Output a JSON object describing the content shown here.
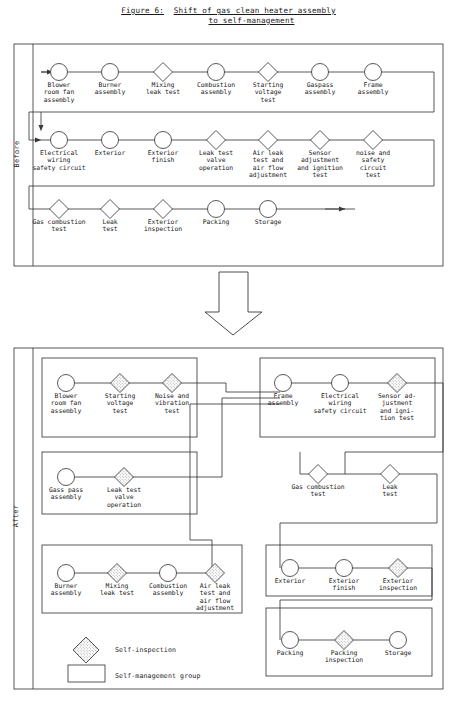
{
  "figure": {
    "label": "Figure 6:",
    "title_line1": "Shift of gas clean heater assembly",
    "title_line2": "to self-management"
  },
  "sections": {
    "before_label": "Before",
    "after_label": "After"
  },
  "legend": {
    "self_inspection": "Self-inspection",
    "self_management_group": "Self-management group"
  },
  "colors": {
    "ink": "#1a1a1a",
    "line": "#3a3a3a",
    "paper": "#ffffff",
    "hatch": "#8a8a8a"
  },
  "before": {
    "row1": [
      {
        "shape": "circle",
        "label": "Blower\nroom fan\nassembly"
      },
      {
        "shape": "circle",
        "label": "Burner\nassembly"
      },
      {
        "shape": "diamond",
        "label": "Mixing\nleak test"
      },
      {
        "shape": "circle",
        "label": "Combustion\nassembly"
      },
      {
        "shape": "diamond",
        "label": "Starting\nvoltage\ntest"
      },
      {
        "shape": "circle",
        "label": "Gaspass\nassembly"
      },
      {
        "shape": "circle",
        "label": "Frame\nassembly"
      }
    ],
    "row2": [
      {
        "shape": "circle",
        "label": "Electrical\nwiring\nsafety circuit"
      },
      {
        "shape": "circle",
        "label": "Exterior"
      },
      {
        "shape": "circle",
        "label": "Exterior\nfinish"
      },
      {
        "shape": "diamond",
        "label": "Leak test\nvalve\noperation"
      },
      {
        "shape": "diamond",
        "label": "Air leak\ntest and\nair flow\nadjustment"
      },
      {
        "shape": "diamond",
        "label": "Sensor\nadjustment\nand ignition\ntest"
      },
      {
        "shape": "diamond",
        "label": "noise and\nsafety\ncircuit\ntest"
      }
    ],
    "row3": [
      {
        "shape": "diamond",
        "label": "Gas combustion\ntest"
      },
      {
        "shape": "diamond",
        "label": "Leak\ntest"
      },
      {
        "shape": "diamond",
        "label": "Exterior\ninspection"
      },
      {
        "shape": "circle",
        "label": "Packing"
      },
      {
        "shape": "circle",
        "label": "Storage"
      }
    ]
  },
  "after": {
    "group1": [
      {
        "shape": "circle",
        "label": "Blower\nroom fan\nassembly"
      },
      {
        "shape": "diamond-sel",
        "label": "Starting\nvoltage\ntest"
      },
      {
        "shape": "diamond-sel",
        "label": "Noise and\nvibration\ntest"
      }
    ],
    "group2": [
      {
        "shape": "circle",
        "label": "Frame\nassembly"
      },
      {
        "shape": "circle",
        "label": "Electrical\nwiring\nsafety circuit"
      },
      {
        "shape": "diamond-sel",
        "label": "Sensor ad-\njustment\nand igni-\ntion test"
      }
    ],
    "group3": [
      {
        "shape": "circle",
        "label": "Gass pass\nassembly"
      },
      {
        "shape": "diamond-sel",
        "label": "Leak test\nvalve\noperation"
      }
    ],
    "group4": [
      {
        "shape": "diamond",
        "label": "Gas combustion\ntest"
      },
      {
        "shape": "diamond",
        "label": "Leak\ntest"
      }
    ],
    "group5": [
      {
        "shape": "circle",
        "label": "Burner\nassembly"
      },
      {
        "shape": "diamond-sel",
        "label": "Mixing\nleak test"
      },
      {
        "shape": "circle",
        "label": "Combustion\nassembly"
      },
      {
        "shape": "diamond-sel",
        "label": "Air leak\ntest and\nair flow\nadjustment"
      }
    ],
    "group6": [
      {
        "shape": "circle",
        "label": "Exterior"
      },
      {
        "shape": "circle",
        "label": "Exterior\nfinish"
      },
      {
        "shape": "diamond-sel",
        "label": "Exterior\ninspection"
      }
    ],
    "group7": [
      {
        "shape": "circle",
        "label": "Packing"
      },
      {
        "shape": "diamond-sel",
        "label": "Packing\ninspection"
      },
      {
        "shape": "circle",
        "label": "Storage"
      }
    ]
  }
}
